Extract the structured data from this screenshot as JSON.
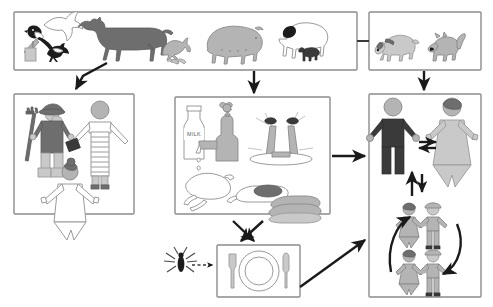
{
  "diagram": {
    "type": "flow-diagram",
    "panels": [
      {
        "id": "livestock-wildlife",
        "name": "livestock-and-wildlife-panel",
        "label": "",
        "items": [
          {
            "name": "magpie-on-post-icon",
            "label": "magpie"
          },
          {
            "name": "flying-bird-icon",
            "label": "flying bird"
          },
          {
            "name": "small-bird-icon",
            "label": "small bird"
          },
          {
            "name": "cow-icon",
            "label": "cow"
          },
          {
            "name": "hen-icon",
            "label": "hen with chicks"
          },
          {
            "name": "pig-icon",
            "label": "pig"
          },
          {
            "name": "sheep-icon",
            "label": "sheep with lamb"
          }
        ]
      },
      {
        "id": "companion-animals",
        "name": "companion-animals-panel",
        "label": "",
        "items": [
          {
            "name": "dog-icon",
            "label": "dog with collar at food bowl"
          },
          {
            "name": "cat-icon",
            "label": "cat at food bowl"
          }
        ]
      },
      {
        "id": "occupational-contact",
        "name": "occupational-contact-panel",
        "label": "",
        "items": [
          {
            "name": "farmer-with-pitchfork-icon",
            "label": "farmer with pitchfork and boots"
          },
          {
            "name": "worker-with-apron-icon",
            "label": "abattoir worker with apron and bag"
          },
          {
            "name": "woman-in-gown-icon",
            "label": "woman in gown"
          }
        ]
      },
      {
        "id": "food-and-water",
        "name": "food-and-water-panel",
        "label": "",
        "items": [
          {
            "name": "milk-bottle-icon",
            "label": "MILK"
          },
          {
            "name": "tap-faucet-icon",
            "label": "tap water"
          },
          {
            "name": "sprinkler-icon",
            "label": "irrigation sprinklers"
          },
          {
            "name": "roast-poultry-icon",
            "label": "poultry meat"
          },
          {
            "name": "meat-on-board-icon",
            "label": "meat on board"
          },
          {
            "name": "meat-stack-icon",
            "label": "stacked meat"
          }
        ]
      },
      {
        "id": "prepared-meal",
        "name": "prepared-meal-panel",
        "label": "",
        "items": [
          {
            "name": "fork-icon",
            "label": "fork"
          },
          {
            "name": "plate-icon",
            "label": "plate"
          },
          {
            "name": "knife-icon",
            "label": "knife"
          }
        ]
      },
      {
        "id": "human-to-human",
        "name": "human-transmission-panel",
        "label": "",
        "items": [
          {
            "name": "adult-man-icon",
            "label": "adult man"
          },
          {
            "name": "adult-woman-icon",
            "label": "adult woman"
          },
          {
            "name": "children-pair-upper-icon",
            "label": "children pair"
          },
          {
            "name": "children-pair-lower-icon",
            "label": "children pair"
          }
        ]
      }
    ],
    "vectors": [
      {
        "name": "insect-vector-icon",
        "label": "insect vector"
      }
    ],
    "labels": {
      "milk": "MILK"
    },
    "arrows": [
      {
        "name": "arrow-livestock-to-occupational",
        "from": "livestock-wildlife",
        "to": "occupational-contact",
        "style": "solid"
      },
      {
        "name": "arrow-livestock-to-food",
        "from": "livestock-wildlife",
        "to": "food-and-water",
        "style": "solid"
      },
      {
        "name": "arrow-companion-to-humans",
        "from": "companion-animals",
        "to": "human-to-human",
        "style": "solid"
      },
      {
        "name": "connector-livestock-to-companion",
        "from": "livestock-wildlife",
        "to": "companion-animals",
        "style": "line"
      },
      {
        "name": "arrow-food-to-humans",
        "from": "food-and-water",
        "to": "human-to-human",
        "style": "solid"
      },
      {
        "name": "arrow-food-to-meal",
        "from": "food-and-water",
        "to": "prepared-meal",
        "style": "crossed"
      },
      {
        "name": "arrow-meal-to-food",
        "from": "prepared-meal",
        "to": "food-and-water",
        "style": "crossed"
      },
      {
        "name": "arrow-meal-to-humans",
        "from": "prepared-meal",
        "to": "human-to-human",
        "style": "solid"
      },
      {
        "name": "arrow-insect-to-meal",
        "from": "insect-vector",
        "to": "prepared-meal",
        "style": "dashed"
      },
      {
        "name": "arrow-man-woman-exchange",
        "from": "adult-man",
        "to": "adult-woman",
        "style": "double"
      },
      {
        "name": "arrow-children-to-adults",
        "from": "children",
        "to": "adults",
        "style": "double-vertical"
      },
      {
        "name": "arrow-children-cycle",
        "from": "children-upper",
        "to": "children-lower",
        "style": "circular"
      }
    ],
    "colors": {
      "panel_border": "#8c8c8c",
      "arrow": "#1a1a1a",
      "dark_figure": "#3a3a3a",
      "mid_figure": "#b4b4b4",
      "light_figure": "#d6d6d6",
      "background": "#ffffff"
    }
  }
}
